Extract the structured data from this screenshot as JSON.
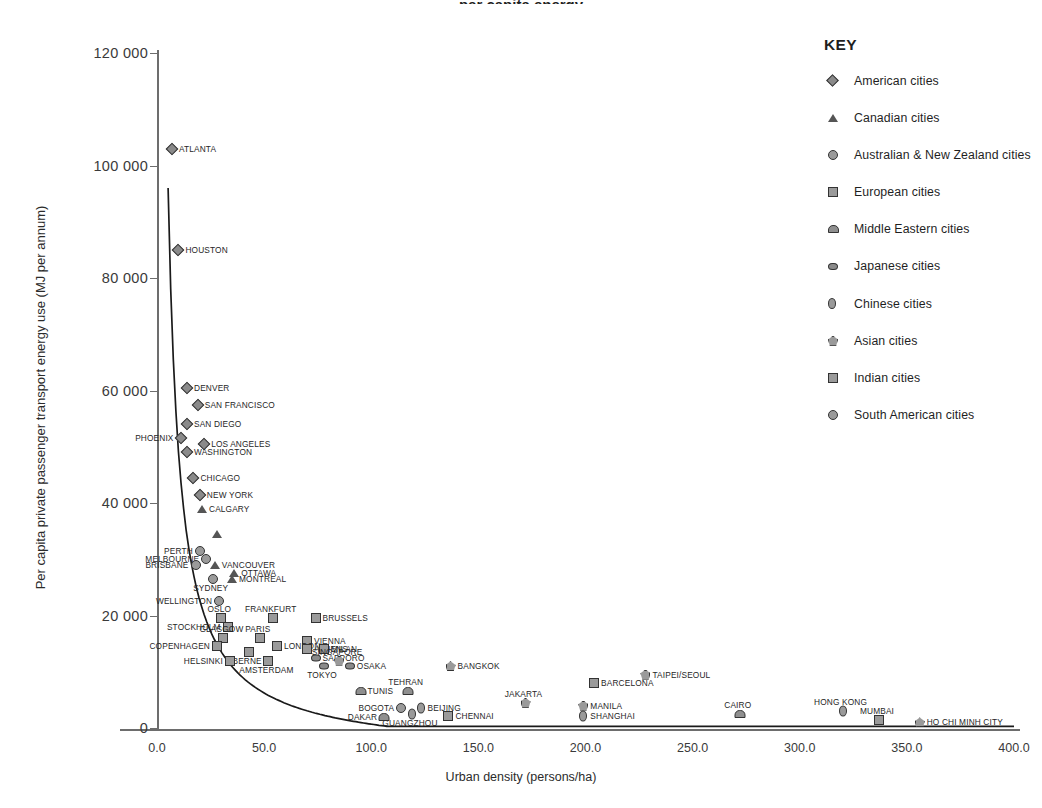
{
  "chart": {
    "title_partial": "per capita energy",
    "xlabel": "Urban density (persons/ha)",
    "ylabel": "Per capita private passenger transport energy use (MJ per annum)",
    "xticks": [
      "0.0",
      "50.0",
      "100.0",
      "150.0",
      "200.0",
      "250.0",
      "300.0",
      "350.0",
      "400.0"
    ],
    "yticks": [
      "120 000",
      "100 000",
      "80 000",
      "60 000",
      "40 000",
      "20 000",
      "0"
    ]
  },
  "key": {
    "title": "KEY",
    "items": [
      {
        "label": "American cities",
        "marker": "diamond"
      },
      {
        "label": "Canadian cities",
        "marker": "triangle"
      },
      {
        "label": "Australian & New Zealand cities",
        "marker": "circle"
      },
      {
        "label": "European cities",
        "marker": "square"
      },
      {
        "label": "Middle Eastern cities",
        "marker": "semi"
      },
      {
        "label": "Japanese cities",
        "marker": "jdiamond"
      },
      {
        "label": "Chinese cities",
        "marker": "oval"
      },
      {
        "label": "Asian cities",
        "marker": "pent"
      },
      {
        "label": "Indian cities",
        "marker": "square"
      },
      {
        "label": "South American cities",
        "marker": "circle"
      }
    ]
  },
  "chart_data": {
    "type": "scatter",
    "xlabel": "Urban density (persons/ha)",
    "ylabel": "Per capita private passenger transport energy use (MJ per annum)",
    "xlim": [
      0,
      400
    ],
    "ylim": [
      0,
      120000
    ],
    "grid": false,
    "legend_position": "right",
    "trendline": "decaying hyperbolic curve fitted through all cities",
    "points": [
      {
        "city": "ATLANTA",
        "x": 7,
        "y": 103000,
        "group": "American cities",
        "marker": "diamond",
        "side": "r"
      },
      {
        "city": "HOUSTON",
        "x": 10,
        "y": 85000,
        "group": "American cities",
        "marker": "diamond",
        "side": "r"
      },
      {
        "city": "DENVER",
        "x": 14,
        "y": 60500,
        "group": "American cities",
        "marker": "diamond",
        "side": "r"
      },
      {
        "city": "SAN FRANCISCO",
        "x": 19,
        "y": 57500,
        "group": "American cities",
        "marker": "diamond",
        "side": "r"
      },
      {
        "city": "SAN DIEGO",
        "x": 14,
        "y": 54000,
        "group": "American cities",
        "marker": "diamond",
        "side": "r"
      },
      {
        "city": "PHOENIX",
        "x": 11,
        "y": 51500,
        "group": "American cities",
        "marker": "diamond",
        "side": "l"
      },
      {
        "city": "LOS ANGELES",
        "x": 22,
        "y": 50500,
        "group": "American cities",
        "marker": "diamond",
        "side": "r"
      },
      {
        "city": "WASHINGTON",
        "x": 14,
        "y": 49000,
        "group": "American cities",
        "marker": "diamond",
        "side": "r"
      },
      {
        "city": "CHICAGO",
        "x": 17,
        "y": 44500,
        "group": "American cities",
        "marker": "diamond",
        "side": "r"
      },
      {
        "city": "NEW YORK",
        "x": 20,
        "y": 41500,
        "group": "American cities",
        "marker": "diamond",
        "side": "r"
      },
      {
        "city": "CALGARY",
        "x": 21,
        "y": 39000,
        "group": "Canadian cities",
        "marker": "triangle",
        "side": "r"
      },
      {
        "city": "TORONTO",
        "x": 28,
        "y": 34500,
        "group": "Canadian cities",
        "marker": "triangle",
        "side": "none"
      },
      {
        "city": "PERTH",
        "x": 20,
        "y": 31500,
        "group": "Australian & New Zealand cities",
        "marker": "circle",
        "side": "l"
      },
      {
        "city": "MELBOURNE",
        "x": 23,
        "y": 30000,
        "group": "Australian & New Zealand cities",
        "marker": "circle",
        "side": "l"
      },
      {
        "city": "BRISBANE",
        "x": 18,
        "y": 29000,
        "group": "Australian & New Zealand cities",
        "marker": "circle",
        "side": "l"
      },
      {
        "city": "VANCOUVER",
        "x": 27,
        "y": 29000,
        "group": "Canadian cities",
        "marker": "triangle",
        "side": "r"
      },
      {
        "city": "OTTAWA",
        "x": 36,
        "y": 27500,
        "group": "Canadian cities",
        "marker": "triangle",
        "side": "r"
      },
      {
        "city": "MONTREAL",
        "x": 35,
        "y": 26500,
        "group": "Canadian cities",
        "marker": "triangle",
        "side": "r"
      },
      {
        "city": "SYDNEY",
        "x": 26,
        "y": 26500,
        "group": "Australian & New Zealand cities",
        "marker": "circle",
        "side": "b"
      },
      {
        "city": "WELLINGTON",
        "x": 29,
        "y": 22500,
        "group": "Australian & New Zealand cities",
        "marker": "circle",
        "side": "l"
      },
      {
        "city": "OSLO",
        "x": 30,
        "y": 19500,
        "group": "European cities",
        "marker": "square",
        "side": "t"
      },
      {
        "city": "FRANKFURT",
        "x": 54,
        "y": 19500,
        "group": "European cities",
        "marker": "square",
        "side": "t"
      },
      {
        "city": "BRUSSELS",
        "x": 74,
        "y": 19500,
        "group": "European cities",
        "marker": "square",
        "side": "r"
      },
      {
        "city": "STOCKHOLM",
        "x": 33,
        "y": 18000,
        "group": "European cities",
        "marker": "square",
        "side": "l"
      },
      {
        "city": "GLASGOW",
        "x": 31,
        "y": 16000,
        "group": "European cities",
        "marker": "square",
        "side": "t"
      },
      {
        "city": "PARIS",
        "x": 48,
        "y": 16000,
        "group": "European cities",
        "marker": "square",
        "side": "t"
      },
      {
        "city": "VIENNA",
        "x": 70,
        "y": 15500,
        "group": "European cities",
        "marker": "square",
        "side": "r"
      },
      {
        "city": "COPENHAGEN",
        "x": 28,
        "y": 14500,
        "group": "European cities",
        "marker": "square",
        "side": "l"
      },
      {
        "city": "LONDON",
        "x": 56,
        "y": 14500,
        "group": "European cities",
        "marker": "square",
        "side": "r"
      },
      {
        "city": "ATHENS",
        "x": 70,
        "y": 14000,
        "group": "European cities",
        "marker": "square",
        "side": "r"
      },
      {
        "city": "MILAN",
        "x": 78,
        "y": 14000,
        "group": "European cities",
        "marker": "square",
        "side": "r"
      },
      {
        "city": "BERNE",
        "x": 43,
        "y": 13500,
        "group": "European cities",
        "marker": "square",
        "side": "b"
      },
      {
        "city": "SAPPORO",
        "x": 74,
        "y": 12500,
        "group": "Japanese cities",
        "marker": "jdiamond",
        "side": "r"
      },
      {
        "city": "SINGAPORE",
        "x": 85,
        "y": 12000,
        "group": "Asian cities",
        "marker": "pent",
        "side": "t"
      },
      {
        "city": "AMSTERDAM",
        "x": 52,
        "y": 12000,
        "group": "European cities",
        "marker": "square",
        "side": "b"
      },
      {
        "city": "HELSINKI",
        "x": 34,
        "y": 12000,
        "group": "European cities",
        "marker": "square",
        "side": "l"
      },
      {
        "city": "TOKYO",
        "x": 78,
        "y": 11000,
        "group": "Japanese cities",
        "marker": "jdiamond",
        "side": "b"
      },
      {
        "city": "OSAKA",
        "x": 90,
        "y": 11000,
        "group": "Japanese cities",
        "marker": "jdiamond",
        "side": "r"
      },
      {
        "city": "BANGKOK",
        "x": 137,
        "y": 11000,
        "group": "Asian cities",
        "marker": "pent",
        "side": "r"
      },
      {
        "city": "TAIPEI/SEOUL",
        "x": 228,
        "y": 9500,
        "group": "Asian cities",
        "marker": "pent",
        "side": "r"
      },
      {
        "city": "BARCELONA",
        "x": 204,
        "y": 8000,
        "group": "European cities",
        "marker": "square",
        "side": "r"
      },
      {
        "city": "TUNIS",
        "x": 95,
        "y": 6500,
        "group": "Middle Eastern cities",
        "marker": "semi",
        "side": "r"
      },
      {
        "city": "TEHRAN",
        "x": 117,
        "y": 6500,
        "group": "Middle Eastern cities",
        "marker": "semi",
        "side": "t"
      },
      {
        "city": "JAKARTA",
        "x": 172,
        "y": 4500,
        "group": "Asian cities",
        "marker": "pent",
        "side": "t"
      },
      {
        "city": "MANILA",
        "x": 199,
        "y": 4000,
        "group": "Asian cities",
        "marker": "pent",
        "side": "r"
      },
      {
        "city": "BOGOTA",
        "x": 114,
        "y": 3500,
        "group": "South American cities",
        "marker": "circle",
        "side": "l"
      },
      {
        "city": "BEIJING",
        "x": 123,
        "y": 3500,
        "group": "Chinese cities",
        "marker": "oval",
        "side": "r"
      },
      {
        "city": "GUANGZHOU",
        "x": 119,
        "y": 2500,
        "group": "Chinese cities",
        "marker": "oval",
        "side": "b"
      },
      {
        "city": "DAKAR",
        "x": 106,
        "y": 2000,
        "group": "Middle Eastern cities",
        "marker": "semi",
        "side": "l"
      },
      {
        "city": "CHENNAI",
        "x": 136,
        "y": 2200,
        "group": "Indian cities",
        "marker": "square",
        "side": "r"
      },
      {
        "city": "SHANGHAI",
        "x": 199,
        "y": 2200,
        "group": "Chinese cities",
        "marker": "oval",
        "side": "r"
      },
      {
        "city": "CAIRO",
        "x": 272,
        "y": 2500,
        "group": "Middle Eastern cities",
        "marker": "semi",
        "side": "t"
      },
      {
        "city": "HONG KONG",
        "x": 320,
        "y": 3000,
        "group": "Chinese cities",
        "marker": "oval",
        "side": "t"
      },
      {
        "city": "MUMBAI",
        "x": 337,
        "y": 1400,
        "group": "Indian cities",
        "marker": "square",
        "side": "t"
      },
      {
        "city": "HO CHI MINH CITY",
        "x": 356,
        "y": 1000,
        "group": "Asian cities",
        "marker": "pent",
        "side": "r"
      }
    ]
  }
}
